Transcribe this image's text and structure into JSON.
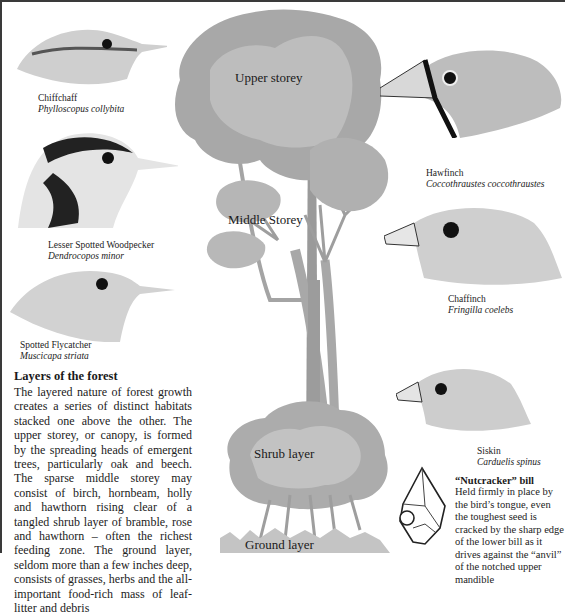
{
  "page": {
    "border_color": "#3a3a3a",
    "tree_color_light": "#b8b8b8",
    "tree_color_mid": "#a4a4a4",
    "tree_color_dark": "#8e8e8e"
  },
  "birds": [
    {
      "common_name": "Chiffchaff",
      "latin_name": "Phylloscopus collybita"
    },
    {
      "common_name": "Lesser Spotted Woodpecker",
      "latin_name": "Dendrocopos minor"
    },
    {
      "common_name": "Spotted Flycatcher",
      "latin_name": "Muscicapa striata"
    },
    {
      "common_name": "Hawfinch",
      "latin_name": "Coccothraustes coccothraustes"
    },
    {
      "common_name": "Chaffinch",
      "latin_name": "Fringilla coelebs"
    },
    {
      "common_name": "Siskin",
      "latin_name": "Carduelis spinus"
    }
  ],
  "tree_labels": {
    "upper": "Upper storey",
    "middle": "Middle Storey",
    "shrub": "Shrub layer",
    "ground": "Ground layer"
  },
  "article": {
    "title": "Layers of the forest",
    "body": "The layered nature of forest growth creates a series of distinct habitats stacked one above the other. The upper storey, or canopy, is formed by the spreading heads of emergent trees, particularly oak and beech. The sparse middle storey may consist of birch, hornbeam, holly and hawthorn rising clear of a tangled shrub layer of bramble, rose and hawthorn – often the richest feeding zone. The ground layer, seldom more than a few inches deep, consists of grasses, herbs and the all-important food-rich mass of leaf-litter and debris"
  },
  "sidebar_note": {
    "title": "“Nutcracker” bill",
    "body": "Held firmly in place by the bird’s tongue, even the toughest seed is cracked by the sharp edge of the lower bill as it drives against the “anvil” of the notched upper mandible"
  }
}
